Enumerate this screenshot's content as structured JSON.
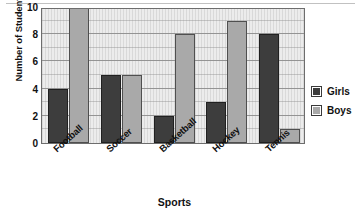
{
  "chart_data": {
    "type": "bar",
    "title": "",
    "xlabel": "Sports",
    "ylabel": "Number of Students",
    "categories": [
      "Football",
      "Soccer",
      "Basketball",
      "Hockey",
      "Tennis"
    ],
    "series": [
      {
        "name": "Girls",
        "color": "#3d3d3d",
        "values": [
          4,
          5,
          2,
          3,
          8
        ]
      },
      {
        "name": "Boys",
        "color": "#a9a9a9",
        "values": [
          10,
          5,
          8,
          9,
          1
        ]
      }
    ],
    "ylim": [
      0,
      10
    ],
    "y_ticks": [
      0,
      2,
      4,
      6,
      8,
      10
    ],
    "y_gridline_values": [
      1,
      2,
      3,
      4,
      5,
      6,
      7,
      8,
      9,
      10
    ],
    "grid": true,
    "legend_position": "right"
  },
  "axes": {
    "y_title": "Number of Students",
    "x_title": "Sports",
    "y_tick_labels": [
      "10",
      "8",
      "6",
      "4",
      "2",
      "0"
    ]
  },
  "legend": {
    "entries": [
      {
        "label": "Girls",
        "swatch": "girls"
      },
      {
        "label": "Boys",
        "swatch": "boys"
      }
    ]
  },
  "footer": {
    "ghost_text": ""
  }
}
